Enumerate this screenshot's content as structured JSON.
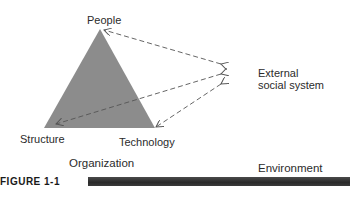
{
  "diagram": {
    "nodes": {
      "people": "People",
      "structure": "Structure",
      "technology": "Technology",
      "external_line1": "External",
      "external_line2": "social system"
    },
    "sections": {
      "organization": "Organization",
      "environment": "Environment"
    },
    "figure_label": "FIGURE 1-1",
    "colors": {
      "triangle_fill": "#8c8c8c",
      "arrow_stroke": "#555555",
      "bar": "#2e2e2e"
    },
    "edges": [
      {
        "from": "external",
        "to": "people",
        "style": "dashed",
        "bidirectional": true
      },
      {
        "from": "external",
        "to": "structure",
        "style": "dashed",
        "bidirectional": true
      },
      {
        "from": "external",
        "to": "technology",
        "style": "dashed",
        "bidirectional": true
      }
    ]
  }
}
